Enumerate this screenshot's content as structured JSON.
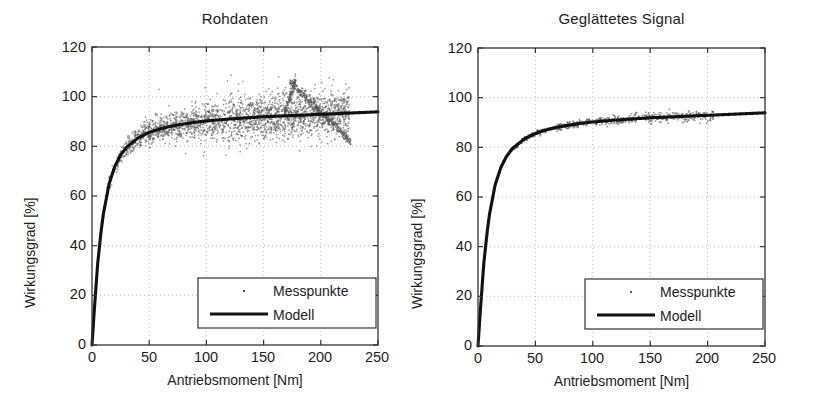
{
  "figure": {
    "background": "#ffffff",
    "foreground": "#1a1a1a",
    "grid_color": "#b4b4b4",
    "marker_color": "#595959",
    "line_color": "#111111"
  },
  "panels": [
    {
      "id": "rohdaten",
      "title": "Rohdaten",
      "legend": {
        "marker_label": "Messpunkte",
        "line_label": "Modell"
      }
    },
    {
      "id": "geglaettetes-signal",
      "title": "Geglättetes Signal",
      "legend": {
        "marker_label": "Messpunkte",
        "line_label": "Modell"
      }
    }
  ],
  "axis": {
    "xlabel": "Antriebsmoment [Nm]",
    "ylabel": "Wirkungsgrad [%]",
    "xticks": [
      "0",
      "50",
      "100",
      "150",
      "200",
      "250"
    ],
    "yticks": [
      "0",
      "20",
      "40",
      "60",
      "80",
      "100",
      "120"
    ]
  },
  "chart_data": [
    {
      "type": "scatter",
      "title": "Rohdaten",
      "xlabel": "Antriebsmoment [Nm]",
      "ylabel": "Wirkungsgrad [%]",
      "xlim": [
        0,
        250
      ],
      "ylim": [
        0,
        120
      ],
      "xticks": [
        0,
        50,
        100,
        150,
        200,
        250
      ],
      "yticks": [
        0,
        20,
        40,
        60,
        80,
        100,
        120
      ],
      "grid": true,
      "legend_position": "lower right",
      "series": [
        {
          "name": "Messpunkte",
          "kind": "scatter",
          "marker": "dot",
          "color": "#595959",
          "description": "Dense noisy efficiency cloud rising steeply from 0% at 0 Nm to about 80% near 35 Nm, then flattening near 88-93% out to 200 Nm, with scatter band half-width growing from ~2% at low torque to ~8% near 120 Nm, outliers up to 115%, plus a narrow descending artifact branch running from about (175 Nm, 106%) down to (225 Nm, 82%)",
          "x_range": [
            0,
            225
          ],
          "y_range": [
            0,
            115
          ],
          "n_points_approx": 2500,
          "noise_band_percent": [
            2,
            8
          ]
        },
        {
          "name": "Modell",
          "kind": "line",
          "color": "#111111",
          "model": "saturating efficiency curve",
          "x": [
            0,
            2,
            5,
            8,
            10,
            15,
            20,
            25,
            30,
            40,
            50,
            60,
            70,
            80,
            90,
            100,
            110,
            120,
            130,
            140,
            150,
            160,
            170,
            180,
            190,
            200,
            210,
            220,
            230,
            240,
            250
          ],
          "y": [
            0,
            14,
            33,
            46,
            53,
            65,
            72,
            76.5,
            79.5,
            83.3,
            85.6,
            87.1,
            88.2,
            89.0,
            89.7,
            90.2,
            90.6,
            91.0,
            91.3,
            91.6,
            91.9,
            92.1,
            92.3,
            92.5,
            92.7,
            92.9,
            93.1,
            93.3,
            93.5,
            93.7,
            93.9
          ]
        }
      ]
    },
    {
      "type": "scatter",
      "title": "Geglättetes Signal",
      "xlabel": "Antriebsmoment [Nm]",
      "ylabel": "Wirkungsgrad [%]",
      "xlim": [
        0,
        250
      ],
      "ylim": [
        0,
        120
      ],
      "xticks": [
        0,
        50,
        100,
        150,
        200,
        250
      ],
      "yticks": [
        0,
        20,
        40,
        60,
        80,
        100,
        120
      ],
      "grid": true,
      "legend_position": "lower right",
      "series": [
        {
          "name": "Messpunkte",
          "kind": "scatter",
          "marker": "dot",
          "color": "#595959",
          "description": "Smoothed measurement points tightly hugging the model curve; dense cluster between 5 and 90 Nm with residual spread under 2%, sparse points out to 200 Nm",
          "x_range": [
            0,
            205
          ],
          "y_range": [
            0,
            95
          ],
          "n_points_approx": 900,
          "noise_band_percent": [
            0.4,
            2
          ]
        },
        {
          "name": "Modell",
          "kind": "line",
          "color": "#111111",
          "model": "saturating efficiency curve",
          "x": [
            0,
            2,
            5,
            8,
            10,
            15,
            20,
            25,
            30,
            40,
            50,
            60,
            70,
            80,
            90,
            100,
            110,
            120,
            130,
            140,
            150,
            160,
            170,
            180,
            190,
            200,
            210,
            220,
            230,
            240,
            250
          ],
          "y": [
            0,
            14,
            33,
            46,
            53,
            65,
            72,
            76.5,
            79.5,
            83.3,
            85.6,
            87.1,
            88.2,
            89.0,
            89.7,
            90.2,
            90.6,
            91.0,
            91.3,
            91.6,
            91.9,
            92.1,
            92.3,
            92.5,
            92.7,
            92.9,
            93.1,
            93.3,
            93.5,
            93.7,
            93.9
          ]
        }
      ]
    }
  ]
}
